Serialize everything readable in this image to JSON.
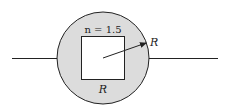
{
  "diagram": {
    "colors": {
      "background": "#ffffff",
      "circle_fill": "#dcdcdc",
      "stroke": "#222222",
      "square_fill": "#ffffff"
    },
    "labels": {
      "index": "n = 1.5",
      "radius": "R",
      "side": "R"
    }
  }
}
